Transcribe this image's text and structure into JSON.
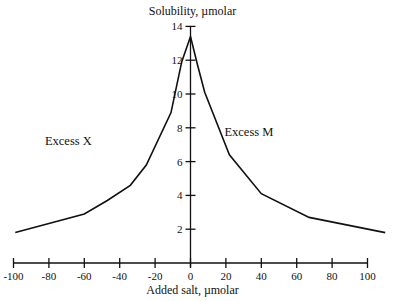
{
  "chart_data": {
    "type": "line",
    "title": "",
    "xlabel": "Added salt, µmolar",
    "ylabel": "Solubility, µmolar",
    "xlim": [
      -100,
      100
    ],
    "ylim": [
      0,
      14
    ],
    "grid": false,
    "legend": null,
    "x_ticks": [
      -100,
      -80,
      -60,
      -40,
      -20,
      0,
      20,
      40,
      60,
      80,
      100
    ],
    "x_tick_labels": [
      "-100",
      "-80",
      "-60",
      "-40",
      "-20",
      "0",
      "20",
      "40",
      "60",
      "80",
      "100"
    ],
    "y_ticks": [
      2,
      4,
      6,
      8,
      10,
      12,
      14
    ],
    "y_tick_labels": [
      "2",
      "4",
      "6",
      "8",
      "10",
      "12",
      "14"
    ],
    "series": [
      {
        "name": "Solubility",
        "color": "#111111",
        "x": [
          -99,
          -60,
          -47,
          -34,
          -25,
          -11,
          -5,
          0,
          4,
          8,
          22,
          40,
          67,
          110
        ],
        "y": [
          1.8,
          2.9,
          3.7,
          4.6,
          5.8,
          8.9,
          11.9,
          13.4,
          11.7,
          10.1,
          6.4,
          4.1,
          2.7,
          1.8
        ]
      }
    ],
    "annotations": [
      {
        "text": "Excess X",
        "x": -69,
        "y": 7.0
      },
      {
        "text": "Excess M",
        "x": 33,
        "y": 7.5
      }
    ]
  }
}
